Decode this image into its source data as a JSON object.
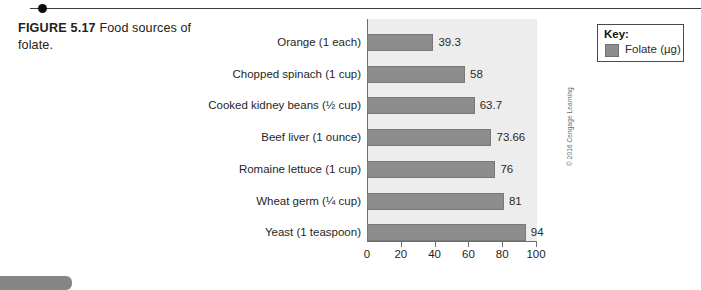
{
  "caption": {
    "figure_label": "FIGURE 5.17",
    "text": " Food sources of folate."
  },
  "legend": {
    "title": "Key:",
    "entries": [
      {
        "label": "Folate (µg)",
        "color": "#8d8d8d"
      }
    ]
  },
  "credit": "© 2016 Cengage Learning",
  "chart_data": {
    "type": "bar",
    "orientation": "horizontal",
    "title": "Food sources of folate",
    "xlabel": "",
    "ylabel": "",
    "xlim": [
      0,
      100
    ],
    "xticks": [
      0,
      20,
      40,
      60,
      80,
      100
    ],
    "xtick_labels": [
      "0",
      "20",
      "40",
      "60",
      "80",
      "100"
    ],
    "grid": false,
    "legend_position": "top-right-outside",
    "bar_color": "#8d8d8d",
    "plot_background": "#ededed",
    "categories": [
      "Orange (1 each)",
      "Chopped spinach (1 cup)",
      "Cooked kidney beans (½ cup)",
      "Beef liver (1 ounce)",
      "Romaine lettuce (1 cup)",
      "Wheat germ (¼ cup)",
      "Yeast (1 teaspoon)"
    ],
    "series": [
      {
        "name": "Folate (µg)",
        "unit": "µg",
        "values": [
          39.3,
          58,
          63.7,
          73.66,
          76,
          81,
          94
        ],
        "value_labels": [
          "39.3",
          "58",
          "63.7",
          "73.66",
          "76",
          "81",
          "94"
        ]
      }
    ]
  }
}
